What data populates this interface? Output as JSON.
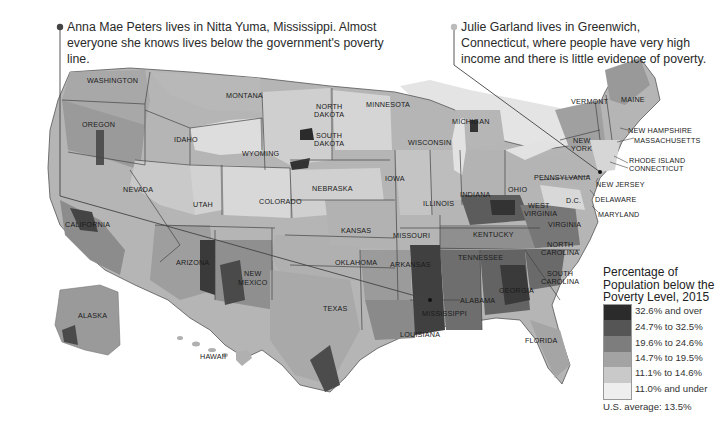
{
  "callouts": {
    "left": {
      "text": "Anna Mae Peters lives in Nitta Yuma, Mississippi. Almost everyone she knows lives below the government's poverty line.",
      "location": "Nitta Yuma, Mississippi",
      "dot_color": "#444444"
    },
    "right": {
      "text": "Julie Garland lives in Greenwich, Connecticut, where people have very high income and there is little evidence of poverty.",
      "location": "Greenwich, Connecticut",
      "dot_color": "#bbbbbb"
    }
  },
  "state_labels": {
    "washington": "WASHINGTON",
    "oregon": "OREGON",
    "california": "CALIFORNIA",
    "nevada": "NEVADA",
    "idaho": "IDAHO",
    "montana": "MONTANA",
    "wyoming": "WYOMING",
    "utah": "UTAH",
    "colorado": "COLORADO",
    "arizona": "ARIZONA",
    "new_mexico_1": "NEW",
    "new_mexico_2": "MEXICO",
    "north_dakota_1": "NORTH",
    "north_dakota_2": "DAKOTA",
    "south_dakota_1": "SOUTH",
    "south_dakota_2": "DAKOTA",
    "nebraska": "NEBRASKA",
    "kansas": "KANSAS",
    "oklahoma": "OKLAHOMA",
    "texas": "TEXAS",
    "minnesota": "MINNESOTA",
    "iowa": "IOWA",
    "missouri": "MISSOURI",
    "arkansas": "ARKANSAS",
    "louisiana": "LOUISIANA",
    "wisconsin": "WISCONSIN",
    "illinois": "ILLINOIS",
    "michigan": "MICHIGAN",
    "indiana": "INDIANA",
    "ohio": "OHIO",
    "kentucky": "KENTUCKY",
    "tennessee": "TENNESSEE",
    "mississippi": "MISSISSIPPI",
    "alabama": "ALABAMA",
    "georgia": "GEORGIA",
    "florida": "FLORIDA",
    "south_carolina_1": "SOUTH",
    "south_carolina_2": "CAROLINA",
    "north_carolina_1": "NORTH",
    "north_carolina_2": "CAROLINA",
    "virginia": "VIRGINIA",
    "west_virginia_1": "WEST",
    "west_virginia_2": "VIRGINIA",
    "pennsylvania": "PENNSYLVANIA",
    "new_york_1": "NEW",
    "new_york_2": "YORK",
    "vermont": "VERMONT",
    "maine": "MAINE",
    "new_hampshire": "NEW HAMPSHIRE",
    "massachusetts": "MASSACHUSETTS",
    "rhode_island": "RHODE ISLAND",
    "connecticut": "CONNECTICUT",
    "new_jersey": "NEW JERSEY",
    "delaware": "DELAWARE",
    "maryland": "MARYLAND",
    "dc": "D.C.",
    "alaska": "ALASKA",
    "hawaii": "HAWAII"
  },
  "legend": {
    "title_line1": "Percentage of",
    "title_line2": "Population below the",
    "title_line3": "Poverty Level, 2015",
    "items": [
      {
        "label": "32.6% and over",
        "color": "#2b2b2b"
      },
      {
        "label": "24.7% to 32.5%",
        "color": "#555555"
      },
      {
        "label": "19.6% to 24.6%",
        "color": "#7d7d7d"
      },
      {
        "label": "14.7% to 19.5%",
        "color": "#a3a3a3"
      },
      {
        "label": "11.1% to 14.6%",
        "color": "#c9c9c9"
      },
      {
        "label": "11.0% and under",
        "color": "#eeeeee"
      }
    ],
    "average": "U.S. average: 13.5%"
  }
}
